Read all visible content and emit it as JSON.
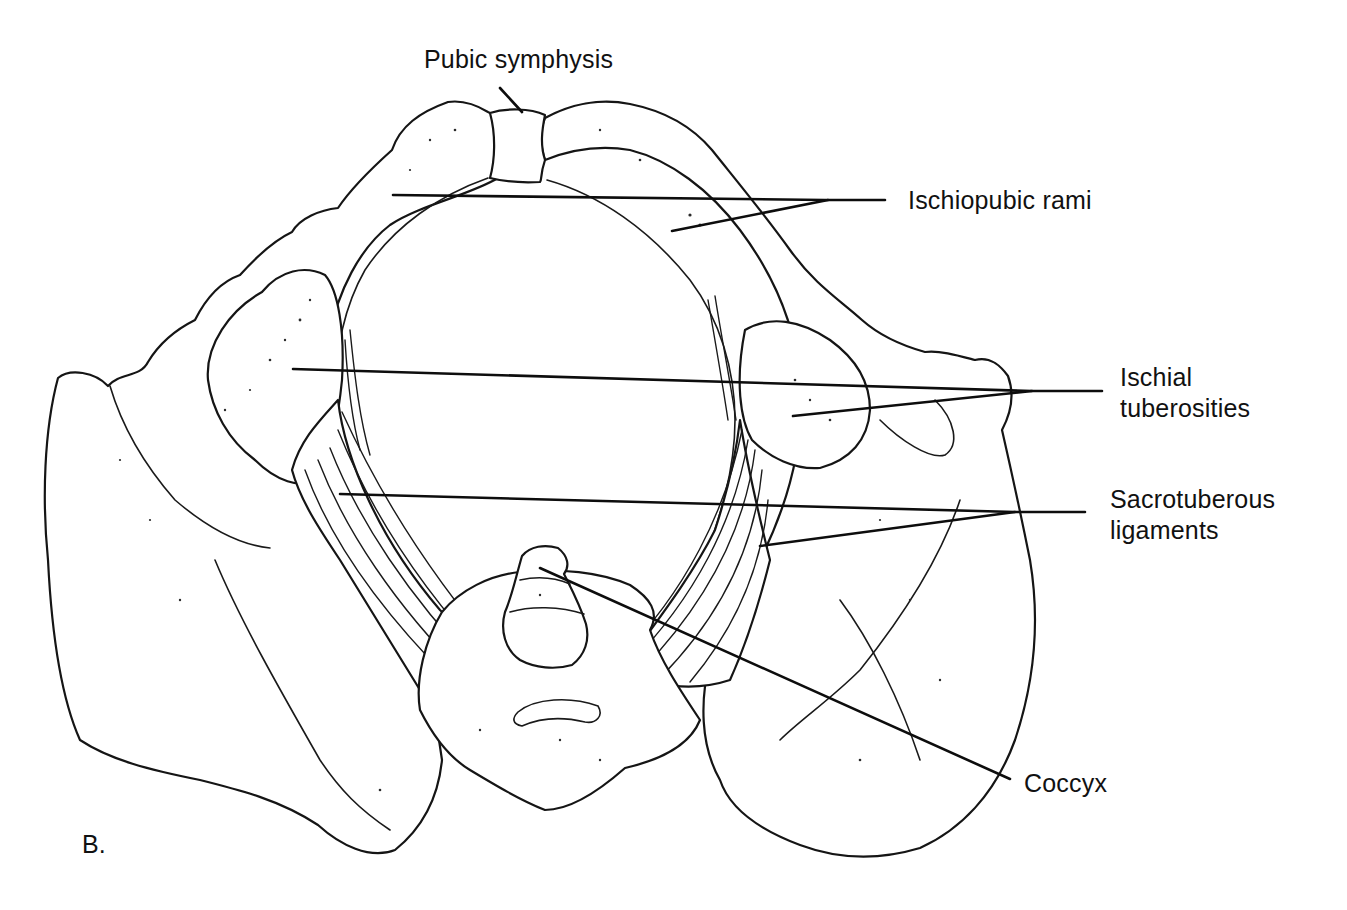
{
  "figure": {
    "panel_letter": "B.",
    "colors": {
      "ink": "#111111",
      "background": "#ffffff"
    }
  },
  "labels": {
    "pubic_symphysis": {
      "text": "Pubic symphysis",
      "x": 424,
      "y": 44
    },
    "ischiopubic_rami": {
      "text": "Ischiopubic rami",
      "x": 908,
      "y": 185
    },
    "ischial_tuberosities": {
      "lines": [
        "Ischial",
        "tuberosities"
      ],
      "x": 1120,
      "y": 362
    },
    "sacrotuberous_ligaments": {
      "lines": [
        "Sacrotuberous",
        "ligaments"
      ],
      "x": 1110,
      "y": 484
    },
    "coccyx": {
      "text": "Coccyx",
      "x": 1024,
      "y": 768
    }
  },
  "leaders": {
    "pubic_symphysis": [
      [
        500,
        88
      ],
      [
        522,
        112
      ]
    ],
    "ischiopubic_rami_a": [
      [
        393,
        195
      ],
      [
        825,
        200
      ],
      [
        885,
        200
      ]
    ],
    "ischiopubic_rami_b": [
      [
        672,
        231
      ],
      [
        828,
        200
      ]
    ],
    "ischial_tuberosities_a": [
      [
        293,
        369
      ],
      [
        1032,
        391
      ],
      [
        1102,
        391
      ]
    ],
    "ischial_tuberosities_b": [
      [
        793,
        416
      ],
      [
        1032,
        391
      ]
    ],
    "sacrotuberous_ligaments_a": [
      [
        340,
        494
      ],
      [
        1015,
        512
      ],
      [
        1085,
        512
      ]
    ],
    "sacrotuberous_ligaments_b": [
      [
        760,
        546
      ],
      [
        1015,
        512
      ]
    ],
    "coccyx": [
      [
        540,
        568
      ],
      [
        1010,
        779
      ]
    ]
  }
}
